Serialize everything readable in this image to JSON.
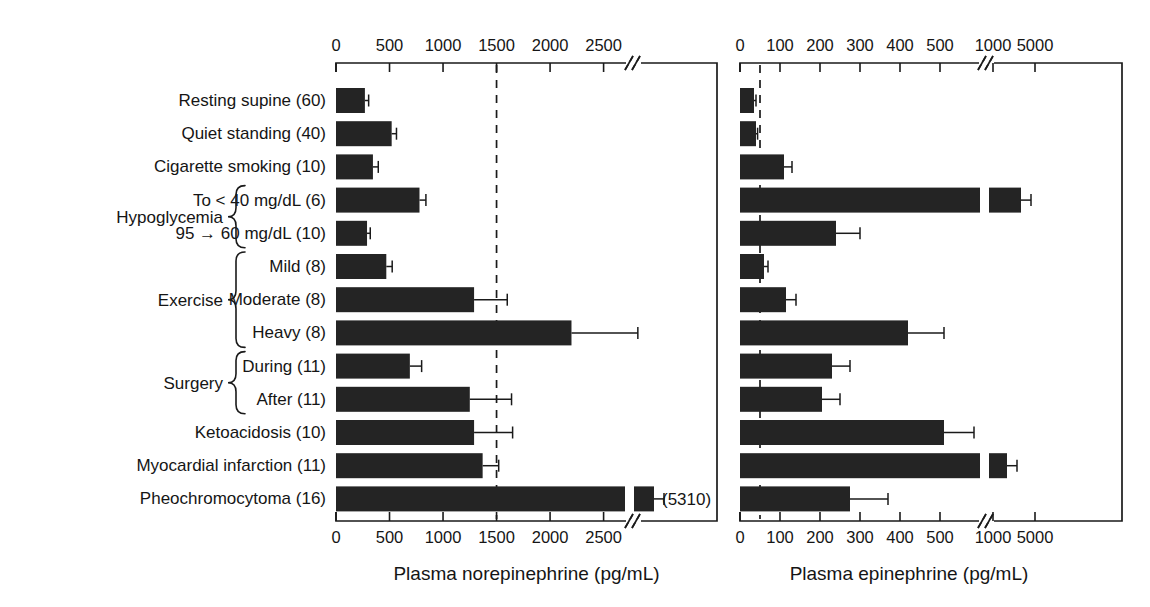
{
  "figure": {
    "background": "#ffffff",
    "bar_color": "#242424",
    "axis_color": "#1a1a1a",
    "threshold_line_style": "dashed"
  },
  "categories": [
    {
      "label": "Resting supine (60)",
      "n": 60,
      "group": null
    },
    {
      "label": "Quiet standing (40)",
      "n": 40,
      "group": null
    },
    {
      "label": "Cigarette smoking (10)",
      "n": 10,
      "group": null
    },
    {
      "label": "To < 40 mg/dL (6)",
      "n": 6,
      "group": "Hypoglycemia"
    },
    {
      "label": "95 → 60 mg/dL (10)",
      "n": 10,
      "group": "Hypoglycemia"
    },
    {
      "label": "Mild (8)",
      "n": 8,
      "group": "Exercise"
    },
    {
      "label": "Moderate (8)",
      "n": 8,
      "group": "Exercise"
    },
    {
      "label": "Heavy (8)",
      "n": 8,
      "group": "Exercise"
    },
    {
      "label": "During (11)",
      "n": 11,
      "group": "Surgery"
    },
    {
      "label": "After (11)",
      "n": 11,
      "group": "Surgery"
    },
    {
      "label": "Ketoacidosis (10)",
      "n": 10,
      "group": null
    },
    {
      "label": "Myocardial infarction (11)",
      "n": 11,
      "group": null
    },
    {
      "label": "Pheochromocytoma (16)",
      "n": 16,
      "group": null
    }
  ],
  "group_brackets": [
    {
      "label": "Hypoglycemia",
      "first": 3,
      "last": 4
    },
    {
      "label": "Exercise",
      "first": 5,
      "last": 7
    },
    {
      "label": "Surgery",
      "first": 8,
      "last": 9
    }
  ],
  "chart_data": [
    {
      "type": "bar",
      "orientation": "horizontal",
      "panel": "left",
      "title": "",
      "xlabel": "Plasma norepinephrine (pg/mL)",
      "ylabel": "",
      "xlim": [
        0,
        2800
      ],
      "grid": false,
      "legend": null,
      "axis_break": {
        "at": 2700,
        "style": "//"
      },
      "threshold_line": {
        "value": 1500,
        "style": "dashed"
      },
      "tick_labels": [
        "0",
        "500",
        "1000",
        "1500",
        "2000",
        "2500"
      ],
      "tick_values": [
        0,
        500,
        1000,
        1500,
        2000,
        2500
      ],
      "categories": [
        "Resting supine (60)",
        "Quiet standing (40)",
        "Cigarette smoking (10)",
        "To < 40 mg/dL (6)",
        "95 → 60 mg/dL (10)",
        "Mild (8)",
        "Moderate (8)",
        "Heavy (8)",
        "During (11)",
        "After (11)",
        "Ketoacidosis (10)",
        "Myocardial infarction (11)",
        "Pheochromocytoma (16)"
      ],
      "values": [
        270,
        520,
        345,
        780,
        290,
        470,
        1290,
        2200,
        690,
        1250,
        1290,
        1370,
        5310
      ],
      "errors": [
        35,
        45,
        50,
        60,
        30,
        55,
        310,
        620,
        110,
        390,
        360,
        150,
        110
      ],
      "annotations": [
        {
          "text": "(5310)",
          "category": "Pheochromocytoma (16)"
        }
      ]
    },
    {
      "type": "bar",
      "orientation": "horizontal",
      "panel": "right",
      "title": "",
      "xlabel": "Plasma epinephrine (pg/mL)",
      "ylabel": "",
      "xlim": [
        0,
        5500
      ],
      "grid": false,
      "legend": null,
      "axis_break": {
        "at": 600,
        "style": "//"
      },
      "threshold_line": {
        "value": 50,
        "style": "dashed"
      },
      "tick_labels": [
        "0",
        "100",
        "200",
        "300",
        "400",
        "500",
        "1000",
        "5000"
      ],
      "tick_values": [
        0,
        100,
        200,
        300,
        400,
        500,
        1000,
        5000
      ],
      "categories": [
        "Resting supine (60)",
        "Quiet standing (40)",
        "Cigarette smoking (10)",
        "To < 40 mg/dL (6)",
        "95 → 60 mg/dL (10)",
        "Mild (8)",
        "Moderate (8)",
        "Heavy (8)",
        "During (11)",
        "After (11)",
        "Ketoacidosis (10)",
        "Myocardial infarction (11)",
        "Pheochromocytoma (16)"
      ],
      "values": [
        35,
        40,
        110,
        1150,
        240,
        60,
        115,
        420,
        230,
        205,
        510,
        1000,
        275
      ],
      "errors": [
        5,
        4,
        20,
        90,
        60,
        10,
        25,
        90,
        45,
        45,
        75,
        50,
        95
      ]
    }
  ],
  "axis_titles": {
    "left": "Plasma norepinephrine (pg/mL)",
    "right": "Plasma epinephrine (pg/mL)"
  }
}
